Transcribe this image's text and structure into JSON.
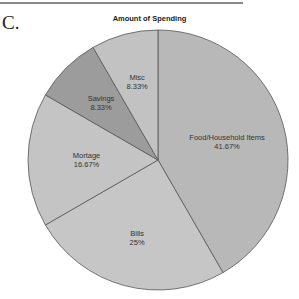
{
  "panel_label": "C.",
  "chart_data": {
    "type": "pie",
    "title": "Amount of Spending",
    "start_angle": "12 o'clock, clockwise",
    "slices": [
      {
        "label": "Food/Household Items",
        "value": 41.67,
        "value_label": "41.67%",
        "color": "#b8b8b8"
      },
      {
        "label": "Bills",
        "value": 25,
        "value_label": "25%",
        "color": "#c6c6c6"
      },
      {
        "label": "Mortage",
        "value": 16.67,
        "value_label": "16.67%",
        "color": "#c4c4c4"
      },
      {
        "label": "Savings",
        "value": 8.33,
        "value_label": "8.33%",
        "color": "#9c9c9c"
      },
      {
        "label": "Misc",
        "value": 8.33,
        "value_label": "8.33%",
        "color": "#c2c2c2"
      }
    ],
    "legend": "none",
    "edge_color": "#555555"
  }
}
